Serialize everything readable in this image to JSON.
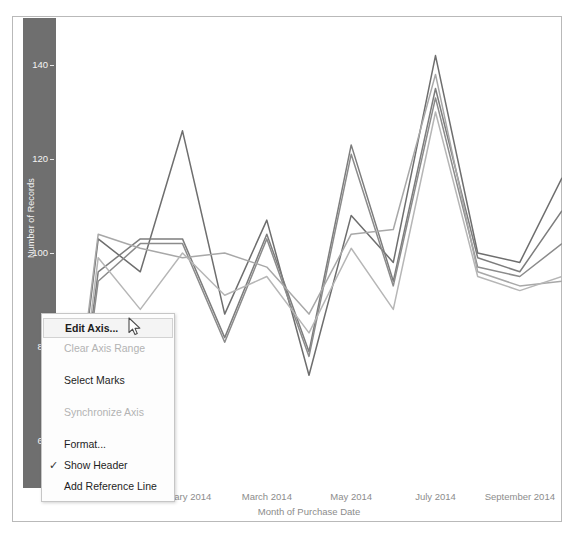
{
  "viz": {
    "y_axis": {
      "title": "Number of Records",
      "ticks": [
        "140",
        "120",
        "100",
        "80",
        "60"
      ],
      "tick_values": [
        140,
        120,
        100,
        80,
        60
      ],
      "selected": true,
      "band_color": "#6f6f6f"
    },
    "x_axis": {
      "title": "Month of Purchase Date",
      "ticks": [
        "November 2013",
        "January 2014",
        "March 2014",
        "May 2014",
        "July 2014",
        "September 2014"
      ]
    }
  },
  "context_menu": {
    "items": [
      {
        "label": "Edit Axis...",
        "state": "highlighted",
        "check": ""
      },
      {
        "label": "Clear Axis Range",
        "state": "disabled",
        "check": ""
      },
      {
        "label": "Select Marks",
        "state": "enabled",
        "check": ""
      },
      {
        "label": "Synchronize Axis",
        "state": "disabled",
        "check": ""
      },
      {
        "label": "Format...",
        "state": "enabled",
        "check": ""
      },
      {
        "label": "Show Header",
        "state": "enabled",
        "check": "✓"
      },
      {
        "label": "Add Reference Line",
        "state": "enabled",
        "check": ""
      }
    ]
  },
  "chart_data": {
    "type": "line",
    "title": "",
    "xlabel": "Month of Purchase Date",
    "ylabel": "Number of Records",
    "ylim": [
      50,
      150
    ],
    "yticks": [
      60,
      80,
      100,
      120,
      140
    ],
    "grid": false,
    "legend": "none",
    "x": [
      "October 2013",
      "November 2013",
      "December 2013",
      "January 2014",
      "February 2014",
      "March 2014",
      "April 2014",
      "May 2014",
      "June 2014",
      "July 2014",
      "August 2014",
      "September 2014",
      "October 2014"
    ],
    "xticks": [
      "November 2013",
      "January 2014",
      "March 2014",
      "May 2014",
      "July 2014",
      "September 2014"
    ],
    "series": [
      {
        "name": "Series 1",
        "color": "#6e6e6e",
        "values": [
          30,
          103,
          96,
          126,
          87,
          107,
          74,
          108,
          98,
          142,
          100,
          98,
          116
        ]
      },
      {
        "name": "Series 2",
        "color": "#7d7d7d",
        "values": [
          28,
          96,
          103,
          103,
          82,
          104,
          79,
          123,
          94,
          135,
          99,
          96,
          109
        ]
      },
      {
        "name": "Series 3",
        "color": "#8b8b8b",
        "values": [
          26,
          94,
          102,
          102,
          81,
          103,
          78,
          121,
          93,
          133,
          97,
          95,
          102
        ]
      },
      {
        "name": "Series 4",
        "color": "#a8a8a8",
        "values": [
          32,
          104,
          101,
          99,
          100,
          97,
          87,
          104,
          105,
          138,
          96,
          93,
          94
        ]
      },
      {
        "name": "Series 5",
        "color": "#b6b6b6",
        "values": [
          27,
          99,
          88,
          100,
          91,
          95,
          83,
          101,
          88,
          130,
          95,
          92,
          95
        ]
      }
    ]
  },
  "cursor": {
    "icon": "arrow-pointer",
    "x": 128,
    "y": 317
  }
}
